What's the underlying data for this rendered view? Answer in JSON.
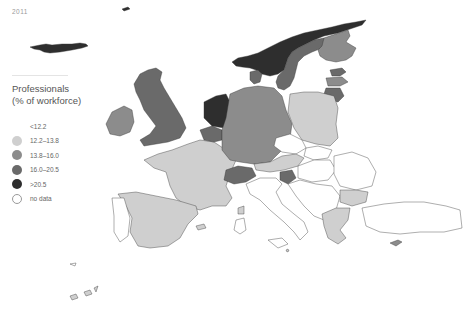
{
  "header": {
    "year": "2011"
  },
  "legend": {
    "title_line1": "Professionals",
    "title_line2": "(% of workforce)",
    "items": [
      {
        "label": "<12.2",
        "color": "#ffffff",
        "border": "#ffffff"
      },
      {
        "label": "12.2–13.8",
        "color": "#cfcfcf",
        "border": "#cfcfcf"
      },
      {
        "label": "13.8–16.0",
        "color": "#8c8c8c",
        "border": "#8c8c8c"
      },
      {
        "label": "16.0–20.5",
        "color": "#6a6a6a",
        "border": "#6a6a6a"
      },
      {
        "label": ">20.5",
        "color": "#2e2e2e",
        "border": "#2e2e2e"
      },
      {
        "label": "no data",
        "color": "#ffffff",
        "border": "#9a9a9a"
      }
    ]
  },
  "colors": {
    "lt12_2": "#ffffff",
    "c12_2_13_8": "#cfcfcf",
    "c13_8_16_0": "#8c8c8c",
    "c16_0_20_5": "#6a6a6a",
    "gt20_5": "#2e2e2e",
    "no_data": "#ffffff"
  },
  "map": {
    "regions": [
      {
        "name": "Iceland",
        "class": ">20.5"
      },
      {
        "name": "Norway",
        "class": ">20.5"
      },
      {
        "name": "Sweden",
        "class": "16.0–20.5"
      },
      {
        "name": "Finland",
        "class": "13.8–16.0"
      },
      {
        "name": "Estonia",
        "class": "16.0–20.5"
      },
      {
        "name": "Latvia",
        "class": "13.8–16.0"
      },
      {
        "name": "Lithuania",
        "class": "16.0–20.5"
      },
      {
        "name": "Denmark",
        "class": "16.0–20.5"
      },
      {
        "name": "United Kingdom",
        "class": "16.0–20.5"
      },
      {
        "name": "Ireland",
        "class": "13.8–16.0"
      },
      {
        "name": "Netherlands",
        "class": ">20.5"
      },
      {
        "name": "Belgium",
        "class": "16.0–20.5"
      },
      {
        "name": "Luxembourg",
        "class": "16.0–20.5"
      },
      {
        "name": "Germany",
        "class": "13.8–16.0"
      },
      {
        "name": "Poland",
        "class": "12.2–13.8"
      },
      {
        "name": "Czech Republic",
        "class": "<12.2"
      },
      {
        "name": "Slovakia",
        "class": "<12.2"
      },
      {
        "name": "Austria",
        "class": "12.2–13.8"
      },
      {
        "name": "Switzerland",
        "class": "16.0–20.5"
      },
      {
        "name": "Slovenia",
        "class": "16.0–20.5"
      },
      {
        "name": "Hungary",
        "class": "<12.2"
      },
      {
        "name": "France",
        "class": "12.2–13.8"
      },
      {
        "name": "Spain",
        "class": "12.2–13.8"
      },
      {
        "name": "Portugal",
        "class": "<12.2"
      },
      {
        "name": "Italy",
        "class": "<12.2"
      },
      {
        "name": "Croatia",
        "class": "<12.2"
      },
      {
        "name": "Romania",
        "class": "<12.2"
      },
      {
        "name": "Bulgaria",
        "class": "12.2–13.8"
      },
      {
        "name": "Greece",
        "class": "12.2–13.8"
      },
      {
        "name": "Turkey",
        "class": "<12.2"
      },
      {
        "name": "Cyprus",
        "class": "13.8–16.0"
      },
      {
        "name": "Malta",
        "class": "12.2–13.8"
      }
    ]
  }
}
